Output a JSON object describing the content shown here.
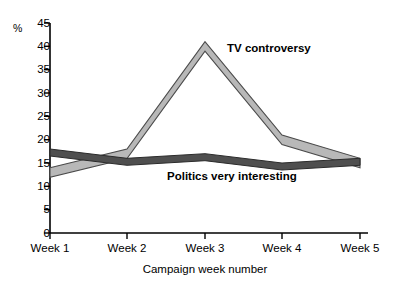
{
  "chart_data": {
    "type": "line",
    "title": "",
    "xlabel": "Campaign week number",
    "ylabel": "%",
    "categories": [
      "Week 1",
      "Week 2",
      "Week 3",
      "Week 4",
      "Week 5"
    ],
    "ylim": [
      0,
      45
    ],
    "ytick_step": 5,
    "yticks": [
      "45",
      "40",
      "35",
      "30",
      "25",
      "20",
      "15",
      "10",
      "5",
      "0"
    ],
    "grid": false,
    "legend_position": "inline-annotation",
    "series": [
      {
        "name": "TV controversy",
        "values": [
          14,
          18,
          41,
          21,
          16
        ],
        "color": "#b5b5b5",
        "style": "ribbon-light"
      },
      {
        "name": "Politics very interesting",
        "values": [
          18,
          16,
          17,
          15,
          16
        ],
        "color": "#4d4d4d",
        "style": "ribbon-dark"
      }
    ],
    "annotations": [
      {
        "text": "TV controversy",
        "series": "TV controversy"
      },
      {
        "text": "Politics very interesting",
        "series": "Politics very interesting"
      }
    ]
  },
  "axes": {
    "y_unit_label": "%",
    "x_axis_title": "Campaign week number"
  },
  "colors": {
    "axis": "#000000",
    "tv_controversy": "#b5b5b5",
    "politics_very_interesting": "#4d4d4d",
    "background": "#ffffff"
  }
}
